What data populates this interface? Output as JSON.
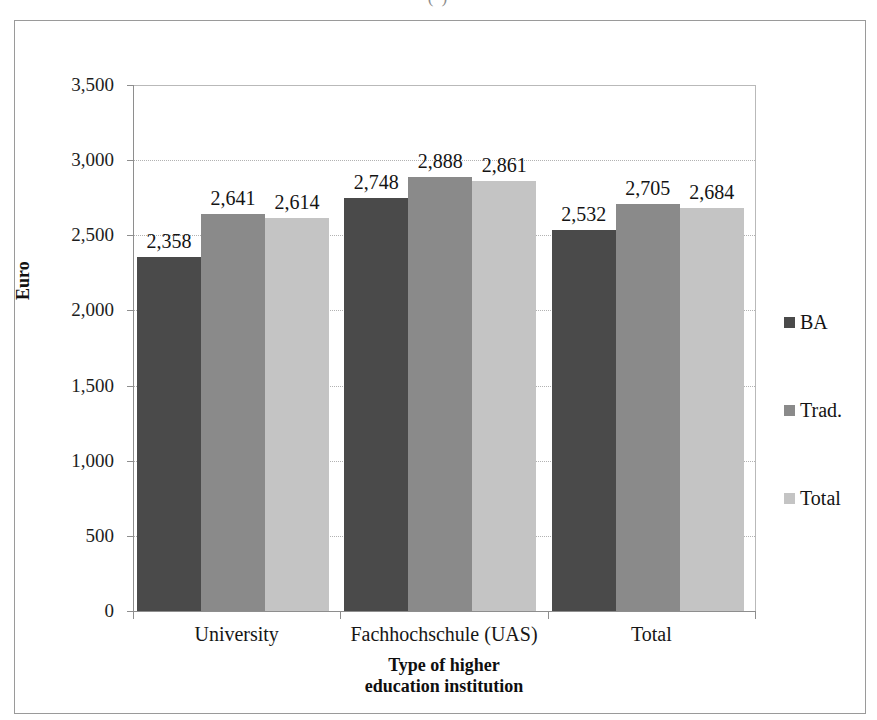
{
  "page": {
    "top_cut_fragment": "(   )"
  },
  "chart_data": {
    "type": "bar",
    "title": "",
    "xlabel": "Type of higher\neducation institution",
    "xlabel_line1": "Type of higher",
    "xlabel_line2": "education institution",
    "ylabel": "Euro",
    "ylim": [
      0,
      3500
    ],
    "ytick_step": 500,
    "ytick_labels": [
      "0",
      "500",
      "1,000",
      "1,500",
      "2,000",
      "2,500",
      "3,000",
      "3,500"
    ],
    "ytick_values": [
      0,
      500,
      1000,
      1500,
      2000,
      2500,
      3000,
      3500
    ],
    "grid": "horizontal-dotted",
    "legend_position": "right",
    "categories": [
      "University",
      "Fachhochschule (UAS)",
      "Total"
    ],
    "series": [
      {
        "name": "BA",
        "color": "#4a4a4a",
        "values": [
          2358,
          2748,
          2532
        ],
        "labels": [
          "2,358",
          "2,748",
          "2,532"
        ]
      },
      {
        "name": "Trad.",
        "color": "#8a8a8a",
        "values": [
          2641,
          2888,
          2705
        ],
        "labels": [
          "2,641",
          "2,888",
          "2,705"
        ]
      },
      {
        "name": "Total",
        "color": "#c4c4c4",
        "values": [
          2614,
          2861,
          2684
        ],
        "labels": [
          "2,614",
          "2,861",
          "2,684"
        ]
      }
    ]
  },
  "colors": {
    "axis": "#8e8e8e",
    "grid": "#b2b2b2",
    "frame": "#9a9a9a",
    "text": "#141414"
  }
}
